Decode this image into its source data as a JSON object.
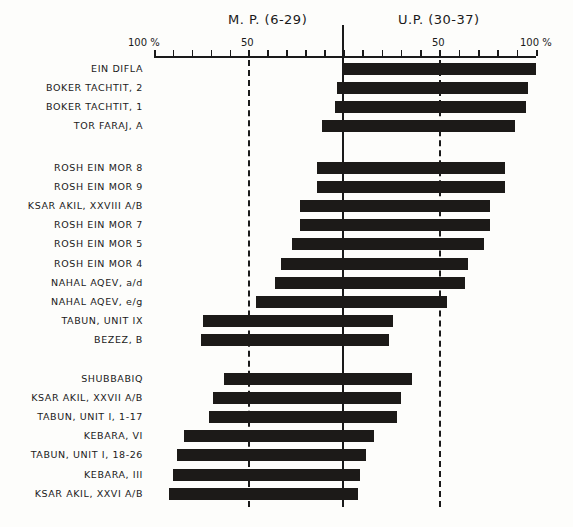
{
  "chart_data": {
    "type": "bar",
    "subtype": "diverging-horizontal",
    "title_left": "M. P. (6-29)",
    "title_right": "U.P. (30-37)",
    "axis": {
      "left_labels": [
        "100 %",
        "50"
      ],
      "right_labels": [
        "50",
        "100 %"
      ],
      "range_left": [
        0,
        100
      ],
      "range_right": [
        0,
        100
      ],
      "tick_step": 10,
      "grid": "dashed lines at 50% on both sides, solid center line"
    },
    "groups": [
      {
        "rows": [
          {
            "label": "EIN DIFLA",
            "mp": 0,
            "up": 100
          },
          {
            "label": "BOKER TACHTIT, 2",
            "mp": 3,
            "up": 96
          },
          {
            "label": "BOKER TACHTIT, 1",
            "mp": 4,
            "up": 95
          },
          {
            "label": "TOR FARAJ, A",
            "mp": 11,
            "up": 89
          }
        ]
      },
      {
        "rows": [
          {
            "label": "ROSH EIN MOR 8",
            "mp": 14,
            "up": 84
          },
          {
            "label": "ROSH EIN MOR 9",
            "mp": 14,
            "up": 84
          },
          {
            "label": "KSAR AKIL, XXVIII A/B",
            "mp": 23,
            "up": 76
          },
          {
            "label": "ROSH EIN MOR 7",
            "mp": 23,
            "up": 76
          },
          {
            "label": "ROSH EIN MOR 5",
            "mp": 27,
            "up": 73
          },
          {
            "label": "ROSH EIN MOR 4",
            "mp": 33,
            "up": 65
          },
          {
            "label": "NAHAL AQEV, a/d",
            "mp": 36,
            "up": 63
          },
          {
            "label": "NAHAL AQEV, e/g",
            "mp": 46,
            "up": 54
          },
          {
            "label": "TABUN, UNIT IX",
            "mp": 74,
            "up": 26
          },
          {
            "label": "BEZEZ, B",
            "mp": 75,
            "up": 24
          }
        ]
      },
      {
        "rows": [
          {
            "label": "SHUBBABIQ",
            "mp": 63,
            "up": 36
          },
          {
            "label": "KSAR AKIL, XXVII A/B",
            "mp": 69,
            "up": 30
          },
          {
            "label": "TABUN, UNIT I, 1-17",
            "mp": 71,
            "up": 28
          },
          {
            "label": "KEBARA, VI",
            "mp": 84,
            "up": 16
          },
          {
            "label": "TABUN, UNIT I, 18-26",
            "mp": 88,
            "up": 12
          },
          {
            "label": "KEBARA, III",
            "mp": 90,
            "up": 9
          },
          {
            "label": "KSAR AKIL, XXVI A/B",
            "mp": 92,
            "up": 8
          }
        ]
      }
    ],
    "bar_color": "#1c1a18",
    "xlabel": "",
    "ylabel": ""
  }
}
